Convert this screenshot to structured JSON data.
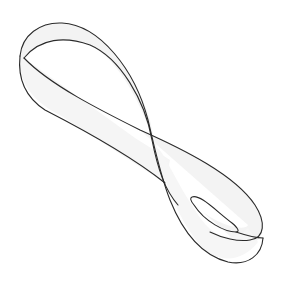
{
  "figure": {
    "colors": {
      "background": "#ffffff",
      "stroke": "#2a2a2a",
      "fill": "#f4f4f4",
      "inner_fill": "#ffffff"
    }
  }
}
